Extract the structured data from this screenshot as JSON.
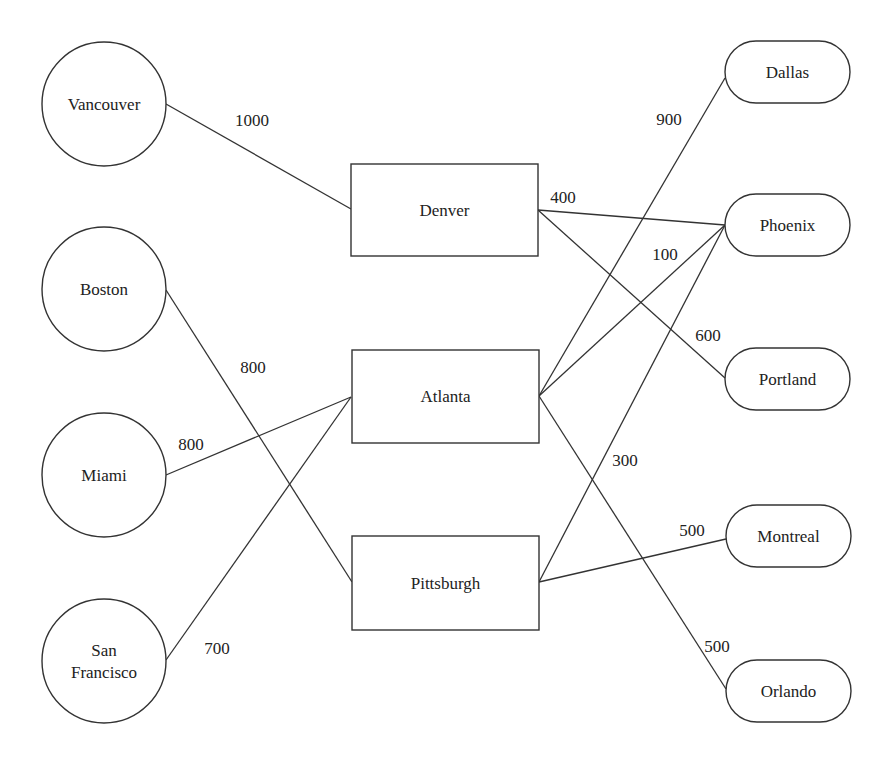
{
  "diagram": {
    "type": "transportation-network",
    "sources": [
      {
        "id": "vancouver",
        "label": [
          "Vancouver"
        ],
        "shape": "circle",
        "cx": 104,
        "cy": 104,
        "r": 62
      },
      {
        "id": "boston",
        "label": [
          "Boston"
        ],
        "shape": "circle",
        "cx": 104,
        "cy": 289,
        "r": 62
      },
      {
        "id": "miami",
        "label": [
          "Miami"
        ],
        "shape": "circle",
        "cx": 104,
        "cy": 475,
        "r": 62
      },
      {
        "id": "san-francisco",
        "label": [
          "San",
          "Francisco"
        ],
        "shape": "circle",
        "cx": 104,
        "cy": 661,
        "r": 62
      }
    ],
    "hubs": [
      {
        "id": "denver",
        "label": [
          "Denver"
        ],
        "shape": "rect",
        "x": 351,
        "y": 164,
        "w": 187,
        "h": 92
      },
      {
        "id": "atlanta",
        "label": [
          "Atlanta"
        ],
        "shape": "rect",
        "x": 352,
        "y": 350,
        "w": 187,
        "h": 93
      },
      {
        "id": "pittsburgh",
        "label": [
          "Pittsburgh"
        ],
        "shape": "rect",
        "x": 352,
        "y": 536,
        "w": 187,
        "h": 94
      }
    ],
    "destinations": [
      {
        "id": "dallas",
        "label": [
          "Dallas"
        ],
        "shape": "stadium",
        "x": 725,
        "y": 41,
        "w": 125,
        "h": 62
      },
      {
        "id": "phoenix",
        "label": [
          "Phoenix"
        ],
        "shape": "stadium",
        "x": 725,
        "y": 194,
        "w": 125,
        "h": 62
      },
      {
        "id": "portland",
        "label": [
          "Portland"
        ],
        "shape": "stadium",
        "x": 725,
        "y": 348,
        "w": 125,
        "h": 62
      },
      {
        "id": "montreal",
        "label": [
          "Montreal"
        ],
        "shape": "stadium",
        "x": 726,
        "y": 505,
        "w": 125,
        "h": 62
      },
      {
        "id": "orlando",
        "label": [
          "Orlando"
        ],
        "shape": "stadium",
        "x": 726,
        "y": 660,
        "w": 125,
        "h": 62
      }
    ],
    "edges": [
      {
        "from": "vancouver",
        "to": "denver",
        "label": "1000",
        "x1": 166,
        "y1": 104,
        "x2": 351,
        "y2": 209,
        "lx": 252,
        "ly": 120
      },
      {
        "from": "boston",
        "to": "pittsburgh",
        "label": "800",
        "x1": 166,
        "y1": 290,
        "x2": 352,
        "y2": 582,
        "lx": 253,
        "ly": 367
      },
      {
        "from": "miami",
        "to": "atlanta",
        "label": "800",
        "x1": 166,
        "y1": 475,
        "x2": 351,
        "y2": 397,
        "lx": 191,
        "ly": 444
      },
      {
        "from": "san-francisco",
        "to": "atlanta",
        "label": "700",
        "x1": 166,
        "y1": 660,
        "x2": 351,
        "y2": 397,
        "lx": 217,
        "ly": 648
      },
      {
        "from": "denver",
        "to": "phoenix",
        "label": "400",
        "x1": 538,
        "y1": 210,
        "x2": 725,
        "y2": 225,
        "lx": 563,
        "ly": 197
      },
      {
        "from": "denver",
        "to": "portland",
        "label": "600",
        "x1": 538,
        "y1": 210,
        "x2": 725,
        "y2": 378,
        "lx": 708,
        "ly": 335
      },
      {
        "from": "atlanta",
        "to": "dallas",
        "label": "900",
        "x1": 539,
        "y1": 396,
        "x2": 725,
        "y2": 78,
        "lx": 669,
        "ly": 119
      },
      {
        "from": "atlanta",
        "to": "phoenix",
        "label": "100",
        "x1": 539,
        "y1": 396,
        "x2": 725,
        "y2": 225,
        "lx": 665,
        "ly": 254
      },
      {
        "from": "atlanta",
        "to": "orlando",
        "label": "500",
        "x1": 539,
        "y1": 396,
        "x2": 726,
        "y2": 689,
        "lx": 717,
        "ly": 646
      },
      {
        "from": "pittsburgh",
        "to": "phoenix",
        "label": "300",
        "x1": 539,
        "y1": 582,
        "x2": 725,
        "y2": 225,
        "lx": 625,
        "ly": 460
      },
      {
        "from": "pittsburgh",
        "to": "montreal",
        "label": "500",
        "x1": 539,
        "y1": 582,
        "x2": 726,
        "y2": 539,
        "lx": 692,
        "ly": 530
      }
    ]
  }
}
